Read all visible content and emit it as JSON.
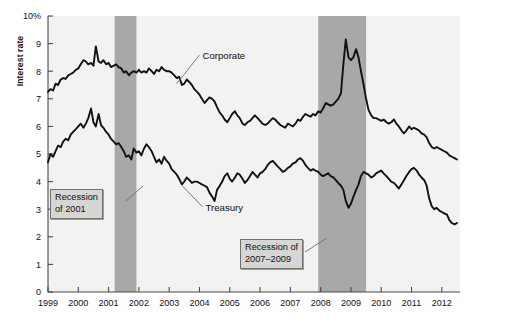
{
  "chart_data": {
    "type": "line",
    "title": "",
    "xlabel": "",
    "ylabel": "Interest rate",
    "ylim": [
      0,
      10
    ],
    "xlim": [
      1999.0,
      2012.6
    ],
    "grid": false,
    "legend_position": "inline-annotations",
    "y_ticks": [
      "0",
      "1",
      "2",
      "3",
      "4",
      "5",
      "6",
      "7",
      "8",
      "9",
      "10%"
    ],
    "y_tick_values": [
      0,
      1,
      2,
      3,
      4,
      5,
      6,
      7,
      8,
      9,
      10
    ],
    "x_ticks": [
      "1999",
      "2000",
      "2001",
      "2002",
      "2003",
      "2004",
      "2005",
      "2006",
      "2007",
      "2008",
      "2009",
      "2010",
      "2011",
      "2012"
    ],
    "x_tick_values": [
      1999,
      2000,
      2001,
      2002,
      2003,
      2004,
      2005,
      2006,
      2007,
      2008,
      2009,
      2010,
      2011,
      2012
    ],
    "shaded_regions": [
      {
        "name": "Recession of 2001",
        "x_start": 2001.2,
        "x_end": 2001.92,
        "color": "#a8a8a8"
      },
      {
        "name": "Recession of 2007-2009",
        "x_start": 2007.92,
        "x_end": 2009.5,
        "color": "#a8a8a8"
      }
    ],
    "series": [
      {
        "name": "Corporate",
        "color": "#111111",
        "x": [
          1999.0,
          1999.08,
          1999.17,
          1999.25,
          1999.33,
          1999.42,
          1999.5,
          1999.58,
          1999.67,
          1999.75,
          1999.83,
          1999.92,
          2000.0,
          2000.08,
          2000.17,
          2000.25,
          2000.33,
          2000.42,
          2000.5,
          2000.58,
          2000.67,
          2000.75,
          2000.83,
          2000.92,
          2001.0,
          2001.08,
          2001.17,
          2001.25,
          2001.33,
          2001.42,
          2001.5,
          2001.58,
          2001.67,
          2001.75,
          2001.83,
          2001.92,
          2002.0,
          2002.08,
          2002.17,
          2002.25,
          2002.33,
          2002.42,
          2002.5,
          2002.58,
          2002.67,
          2002.75,
          2002.83,
          2002.92,
          2003.0,
          2003.08,
          2003.17,
          2003.25,
          2003.33,
          2003.42,
          2003.5,
          2003.58,
          2003.67,
          2003.75,
          2003.83,
          2003.92,
          2004.0,
          2004.08,
          2004.17,
          2004.25,
          2004.33,
          2004.42,
          2004.5,
          2004.58,
          2004.67,
          2004.75,
          2004.83,
          2004.92,
          2005.0,
          2005.08,
          2005.17,
          2005.25,
          2005.33,
          2005.42,
          2005.5,
          2005.58,
          2005.67,
          2005.75,
          2005.83,
          2005.92,
          2006.0,
          2006.08,
          2006.17,
          2006.25,
          2006.33,
          2006.42,
          2006.5,
          2006.58,
          2006.67,
          2006.75,
          2006.83,
          2006.92,
          2007.0,
          2007.08,
          2007.17,
          2007.25,
          2007.33,
          2007.42,
          2007.5,
          2007.58,
          2007.67,
          2007.75,
          2007.83,
          2007.92,
          2008.0,
          2008.08,
          2008.17,
          2008.25,
          2008.33,
          2008.42,
          2008.5,
          2008.58,
          2008.67,
          2008.75,
          2008.83,
          2008.92,
          2009.0,
          2009.08,
          2009.17,
          2009.25,
          2009.33,
          2009.42,
          2009.5,
          2009.58,
          2009.67,
          2009.75,
          2009.83,
          2009.92,
          2010.0,
          2010.08,
          2010.17,
          2010.25,
          2010.33,
          2010.42,
          2010.5,
          2010.58,
          2010.67,
          2010.75,
          2010.83,
          2010.92,
          2011.0,
          2011.08,
          2011.17,
          2011.25,
          2011.33,
          2011.42,
          2011.5,
          2011.58,
          2011.67,
          2011.75,
          2011.83,
          2011.92,
          2012.0,
          2012.08,
          2012.17,
          2012.25,
          2012.33,
          2012.42,
          2012.5
        ],
        "y": [
          7.25,
          7.35,
          7.3,
          7.55,
          7.5,
          7.7,
          7.75,
          7.72,
          7.85,
          7.9,
          7.95,
          8.05,
          8.1,
          8.25,
          8.4,
          8.35,
          8.25,
          8.3,
          8.2,
          8.9,
          8.35,
          8.3,
          8.4,
          8.25,
          8.3,
          8.15,
          8.2,
          8.25,
          8.15,
          8.1,
          7.95,
          8.0,
          7.85,
          7.95,
          8.0,
          7.95,
          8.05,
          7.95,
          8.0,
          7.95,
          8.1,
          8.0,
          7.9,
          8.05,
          8.0,
          8.15,
          8.05,
          8.0,
          8.0,
          7.95,
          7.85,
          7.75,
          7.8,
          7.5,
          7.55,
          7.7,
          7.6,
          7.5,
          7.35,
          7.25,
          7.15,
          7.0,
          6.85,
          6.95,
          7.05,
          7.0,
          6.9,
          6.7,
          6.5,
          6.4,
          6.25,
          6.15,
          6.3,
          6.45,
          6.55,
          6.4,
          6.3,
          6.1,
          6.05,
          6.15,
          6.2,
          6.3,
          6.4,
          6.3,
          6.2,
          6.1,
          6.05,
          6.1,
          6.2,
          6.3,
          6.25,
          6.15,
          6.05,
          6.0,
          5.95,
          6.1,
          6.05,
          6.0,
          6.1,
          6.25,
          6.2,
          6.35,
          6.45,
          6.4,
          6.35,
          6.45,
          6.4,
          6.55,
          6.5,
          6.65,
          6.85,
          6.8,
          6.75,
          6.8,
          6.9,
          7.0,
          7.2,
          8.25,
          9.15,
          8.5,
          8.4,
          8.5,
          8.8,
          8.5,
          8.0,
          7.5,
          7.0,
          6.6,
          6.4,
          6.3,
          6.3,
          6.25,
          6.2,
          6.25,
          6.15,
          6.1,
          6.15,
          6.25,
          6.1,
          6.0,
          5.85,
          5.75,
          5.85,
          6.0,
          5.9,
          5.95,
          5.9,
          5.85,
          5.75,
          5.7,
          5.6,
          5.4,
          5.25,
          5.2,
          5.25,
          5.2,
          5.15,
          5.1,
          5.05,
          4.95,
          4.9,
          4.85,
          4.8
        ]
      },
      {
        "name": "Treasury",
        "color": "#111111",
        "x": [
          1999.0,
          1999.08,
          1999.17,
          1999.25,
          1999.33,
          1999.42,
          1999.5,
          1999.58,
          1999.67,
          1999.75,
          1999.83,
          1999.92,
          2000.0,
          2000.08,
          2000.17,
          2000.25,
          2000.33,
          2000.42,
          2000.5,
          2000.58,
          2000.67,
          2000.75,
          2000.83,
          2000.92,
          2001.0,
          2001.08,
          2001.17,
          2001.25,
          2001.33,
          2001.42,
          2001.5,
          2001.58,
          2001.67,
          2001.75,
          2001.83,
          2001.92,
          2002.0,
          2002.08,
          2002.17,
          2002.25,
          2002.33,
          2002.42,
          2002.5,
          2002.58,
          2002.67,
          2002.75,
          2002.83,
          2002.92,
          2003.0,
          2003.08,
          2003.17,
          2003.25,
          2003.33,
          2003.42,
          2003.5,
          2003.58,
          2003.67,
          2003.75,
          2003.83,
          2003.92,
          2004.0,
          2004.08,
          2004.17,
          2004.25,
          2004.33,
          2004.42,
          2004.5,
          2004.58,
          2004.67,
          2004.75,
          2004.83,
          2004.92,
          2005.0,
          2005.08,
          2005.17,
          2005.25,
          2005.33,
          2005.42,
          2005.5,
          2005.58,
          2005.67,
          2005.75,
          2005.83,
          2005.92,
          2006.0,
          2006.08,
          2006.17,
          2006.25,
          2006.33,
          2006.42,
          2006.5,
          2006.58,
          2006.67,
          2006.75,
          2006.83,
          2006.92,
          2007.0,
          2007.08,
          2007.17,
          2007.25,
          2007.33,
          2007.42,
          2007.5,
          2007.58,
          2007.67,
          2007.75,
          2007.83,
          2007.92,
          2008.0,
          2008.08,
          2008.17,
          2008.25,
          2008.33,
          2008.42,
          2008.5,
          2008.58,
          2008.67,
          2008.75,
          2008.83,
          2008.92,
          2009.0,
          2009.08,
          2009.17,
          2009.25,
          2009.33,
          2009.42,
          2009.5,
          2009.58,
          2009.67,
          2009.75,
          2009.83,
          2009.92,
          2010.0,
          2010.08,
          2010.17,
          2010.25,
          2010.33,
          2010.42,
          2010.5,
          2010.58,
          2010.67,
          2010.75,
          2010.83,
          2010.92,
          2011.0,
          2011.08,
          2011.17,
          2011.25,
          2011.33,
          2011.42,
          2011.5,
          2011.58,
          2011.67,
          2011.75,
          2011.83,
          2011.92,
          2012.0,
          2012.08,
          2012.17,
          2012.25,
          2012.33,
          2012.42,
          2012.5
        ],
        "y": [
          4.7,
          5.0,
          4.9,
          5.1,
          5.3,
          5.25,
          5.45,
          5.55,
          5.5,
          5.7,
          5.8,
          5.9,
          6.0,
          6.1,
          5.95,
          6.1,
          6.3,
          6.65,
          6.15,
          6.0,
          6.45,
          6.05,
          5.95,
          5.8,
          5.7,
          5.55,
          5.45,
          5.35,
          5.4,
          5.25,
          5.1,
          4.9,
          4.95,
          4.8,
          5.2,
          5.05,
          5.1,
          4.95,
          5.2,
          5.35,
          5.25,
          5.1,
          4.9,
          4.7,
          4.8,
          4.65,
          4.9,
          4.75,
          4.65,
          4.45,
          4.35,
          4.25,
          4.1,
          3.9,
          4.0,
          4.15,
          4.05,
          3.95,
          4.0,
          4.0,
          3.95,
          3.9,
          3.85,
          3.8,
          3.6,
          3.45,
          3.3,
          3.7,
          3.85,
          4.0,
          4.2,
          4.3,
          4.1,
          4.0,
          4.15,
          4.3,
          4.25,
          4.1,
          3.95,
          4.05,
          4.2,
          4.35,
          4.25,
          4.15,
          4.3,
          4.35,
          4.45,
          4.6,
          4.7,
          4.75,
          4.65,
          4.55,
          4.45,
          4.35,
          4.4,
          4.5,
          4.55,
          4.65,
          4.7,
          4.8,
          4.85,
          4.75,
          4.6,
          4.5,
          4.4,
          4.45,
          4.4,
          4.35,
          4.25,
          4.2,
          4.25,
          4.3,
          4.2,
          4.15,
          4.05,
          3.95,
          3.85,
          3.7,
          3.3,
          3.05,
          3.2,
          3.45,
          3.7,
          3.9,
          4.2,
          4.35,
          4.3,
          4.25,
          4.15,
          4.2,
          4.3,
          4.35,
          4.4,
          4.3,
          4.2,
          4.1,
          4.0,
          3.95,
          3.85,
          3.75,
          3.9,
          4.05,
          4.2,
          4.35,
          4.45,
          4.5,
          4.4,
          4.25,
          4.15,
          4.05,
          3.85,
          3.4,
          3.1,
          3.0,
          3.05,
          2.95,
          2.9,
          2.85,
          2.8,
          2.6,
          2.5,
          2.45,
          2.5
        ]
      }
    ],
    "annotations": [
      {
        "name": "corporate-label",
        "text": "Corporate",
        "x": 2004.1,
        "y": 8.55
      },
      {
        "name": "treasury-label",
        "text": "Treasury",
        "x": 2004.2,
        "y": 3.05
      },
      {
        "name": "recession-2001-callout",
        "text": "Recession\nof 2001",
        "line1": "Recession",
        "line2": "of 2001"
      },
      {
        "name": "recession-2007-callout",
        "text": "Recession of\n2007–2009",
        "line1": "Recession of",
        "line2": "2007–2009"
      }
    ]
  },
  "axis": {
    "y_title": "Interest rate"
  },
  "labels": {
    "corporate": "Corporate",
    "treasury": "Treasury",
    "recession_2001_line1": "Recession",
    "recession_2001_line2": "of 2001",
    "recession_2007_line1": "Recession of",
    "recession_2007_line2": "2007–2009"
  },
  "colors": {
    "plot_background": "#f2f2f0",
    "band": "#a8a8a8",
    "line": "#111111",
    "axis": "#4a4a4a",
    "callout_bg": "#d6d6d4",
    "callout_border": "#6f6f6f"
  }
}
